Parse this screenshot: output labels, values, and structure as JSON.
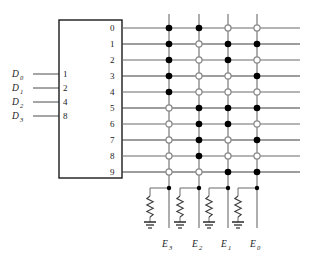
{
  "figure": {
    "type": "logic-diagram",
    "colors": {
      "wire": "#6b6b6b",
      "wire_dark": "#3d3d3d",
      "dot_filled": "#000000",
      "dot_open_stroke": "#8a8a8a",
      "box_stroke": "#1a1a1a",
      "background": "#ffffff"
    }
  },
  "decoder": {
    "name": "bcd-decoder-box",
    "inputs": [
      {
        "signal": "D",
        "index": "0",
        "weight": "1"
      },
      {
        "signal": "D",
        "index": "1",
        "weight": "2"
      },
      {
        "signal": "D",
        "index": "2",
        "weight": "4"
      },
      {
        "signal": "D",
        "index": "3",
        "weight": "8"
      }
    ],
    "outputs": [
      "0",
      "1",
      "2",
      "3",
      "4",
      "5",
      "6",
      "7",
      "8",
      "9"
    ]
  },
  "matrix": {
    "columns": [
      {
        "signal": "E",
        "index": "3"
      },
      {
        "signal": "E",
        "index": "2"
      },
      {
        "signal": "E",
        "index": "1"
      },
      {
        "signal": "E",
        "index": "0"
      }
    ],
    "legend": {
      "filled": "connection",
      "open": "no-connection"
    },
    "rows": [
      {
        "row": "0",
        "cells": [
          "filled",
          "filled",
          "open",
          "open"
        ]
      },
      {
        "row": "1",
        "cells": [
          "filled",
          "open",
          "filled",
          "filled"
        ]
      },
      {
        "row": "2",
        "cells": [
          "filled",
          "open",
          "filled",
          "open"
        ]
      },
      {
        "row": "3",
        "cells": [
          "filled",
          "open",
          "open",
          "filled"
        ]
      },
      {
        "row": "4",
        "cells": [
          "filled",
          "open",
          "open",
          "open"
        ]
      },
      {
        "row": "5",
        "cells": [
          "open",
          "filled",
          "filled",
          "filled"
        ]
      },
      {
        "row": "6",
        "cells": [
          "open",
          "filled",
          "filled",
          "open"
        ]
      },
      {
        "row": "7",
        "cells": [
          "open",
          "filled",
          "open",
          "filled"
        ]
      },
      {
        "row": "8",
        "cells": [
          "open",
          "filled",
          "open",
          "open"
        ]
      },
      {
        "row": "9",
        "cells": [
          "open",
          "open",
          "filled",
          "filled"
        ]
      }
    ]
  },
  "pulldowns": [
    {
      "for": "E3",
      "element": "resistor-to-ground"
    },
    {
      "for": "E2",
      "element": "resistor-to-ground"
    },
    {
      "for": "E1",
      "element": "resistor-to-ground"
    },
    {
      "for": "E0",
      "element": "resistor-to-ground"
    }
  ]
}
